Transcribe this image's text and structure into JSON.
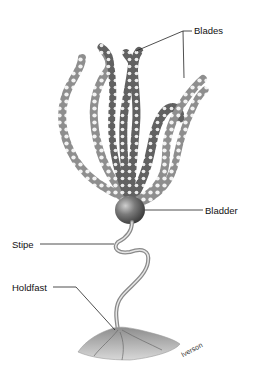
{
  "diagram": {
    "labels": {
      "blades": "Blades",
      "bladder": "Bladder",
      "stipe": "Stipe",
      "holdfast": "Holdfast"
    },
    "artist_credit": "Iverson"
  },
  "colors": {
    "background": "#ffffff",
    "leader_line": "#222222",
    "blade_fill": "#9a9a9a",
    "blade_dark": "#5e5e5e",
    "bladder": "#6a6a6a",
    "holdfast": "#b5b5b5"
  }
}
